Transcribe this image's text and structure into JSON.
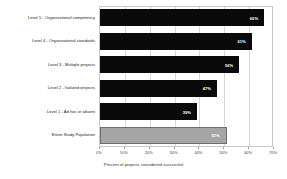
{
  "chart_data": {
    "type": "bar",
    "orientation": "horizontal",
    "title": "",
    "xlabel": "Percent of projects considered successful",
    "ylabel": "",
    "xlim": [
      0,
      70
    ],
    "grid": true,
    "legend": "none",
    "tick_labels": [
      "0%",
      "10%",
      "20%",
      "30%",
      "40%",
      "50%",
      "60%",
      "70%"
    ],
    "tick_values": [
      0,
      10,
      20,
      30,
      40,
      50,
      60,
      70
    ],
    "categories": [
      "Level 5 - Organizational competency",
      "Level 4 - Organizational standards",
      "Level 3 - Multiple projects",
      "Level 2 - Isolated projects",
      "Level 1 - Ad hoc or absent",
      "Entire Study Population"
    ],
    "values": [
      66,
      61,
      56,
      47,
      39,
      51
    ],
    "value_labels": [
      "66%",
      "61%",
      "56%",
      "47%",
      "39%",
      "51%"
    ],
    "bar_colors": [
      "#0a0a0a",
      "#0a0a0a",
      "#0a0a0a",
      "#0a0a0a",
      "#0a0a0a",
      "#a6a6a6"
    ],
    "highlight_index": 5,
    "colors": {
      "bar_primary": "#0a0a0a",
      "bar_highlight": "#a6a6a6",
      "highlight_border": "#6e6e6e",
      "gridline": "#d8d8d8",
      "frame": "#c8c8c8",
      "value_text": "#ffffff",
      "axis_text": "#3c3c3c",
      "background": "#ffffff"
    }
  }
}
